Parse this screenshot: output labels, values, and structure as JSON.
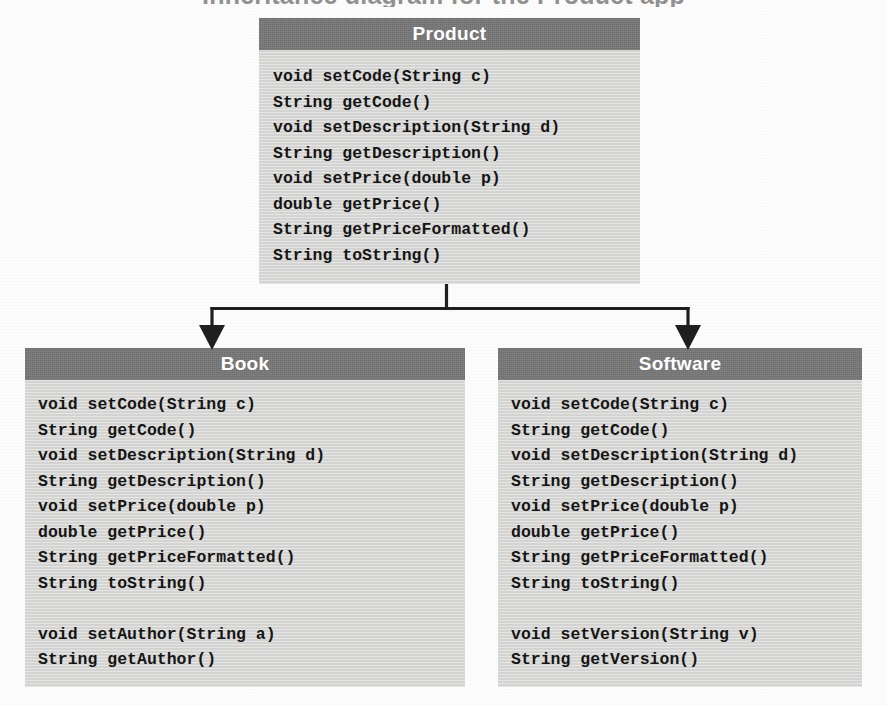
{
  "page": {
    "cut_off_heading": "Inheritance diagram for the Product app",
    "background_color": "#fcfcfc"
  },
  "theme": {
    "header_fill": "#767676",
    "header_text_color": "#ffffff",
    "body_fill": "#d7d7d5",
    "body_text_color": "#151515",
    "connector_color": "#1f1f1f"
  },
  "diagram": {
    "type": "uml-class-diagram",
    "relationship": "inheritance",
    "superclass": "Product",
    "subclasses": [
      "Book",
      "Software"
    ]
  },
  "classes": {
    "product": {
      "name": "Product",
      "methods": [
        "void setCode(String c)",
        "String getCode()",
        "void setDescription(String d)",
        "String getDescription()",
        "void setPrice(double p)",
        "double getPrice()",
        "String getPriceFormatted()",
        "String toString()"
      ]
    },
    "book": {
      "name": "Book",
      "inherited_methods": [
        "void setCode(String c)",
        "String getCode()",
        "void setDescription(String d)",
        "String getDescription()",
        "void setPrice(double p)",
        "double getPrice()",
        "String getPriceFormatted()",
        "String toString()"
      ],
      "own_methods": [
        "void setAuthor(String a)",
        "String getAuthor()"
      ]
    },
    "software": {
      "name": "Software",
      "inherited_methods": [
        "void setCode(String c)",
        "String getCode()",
        "void setDescription(String d)",
        "String getDescription()",
        "void setPrice(double p)",
        "double getPrice()",
        "String getPriceFormatted()",
        "String toString()"
      ],
      "own_methods": [
        "void setVersion(String v)",
        "String getVersion()"
      ]
    }
  }
}
